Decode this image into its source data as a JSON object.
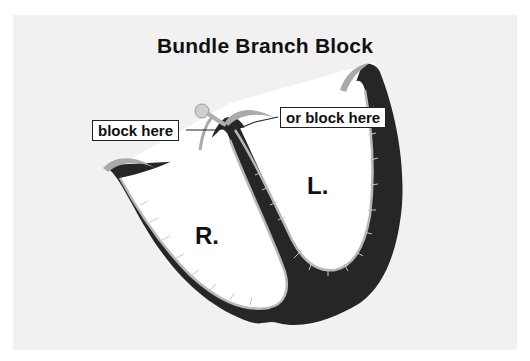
{
  "title": "Bundle Branch Block",
  "callouts": {
    "left": "block here",
    "right": "or block here"
  },
  "chambers": {
    "right_ventricle": "R.",
    "left_ventricle": "L."
  },
  "colors": {
    "panel": "#f1f1f1",
    "myocardium": "#262626",
    "conduction": "#b8b8b8",
    "chamber": "#ffffff"
  }
}
